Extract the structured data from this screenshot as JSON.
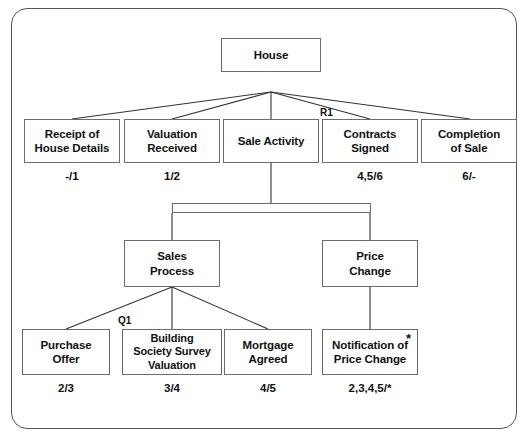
{
  "diagram": {
    "frame": {
      "border_color": "#555555",
      "background": "#ffffff"
    },
    "node_border_color": "#6b6b6b",
    "root": {
      "label": "House"
    },
    "level2": [
      {
        "label": "Receipt of\nHouse Details",
        "annotation": "-/1"
      },
      {
        "label": "Valuation\nReceived",
        "annotation": "1/2"
      },
      {
        "label": "Sale Activity",
        "annotation": ""
      },
      {
        "label": "Contracts\nSigned",
        "annotation": "4,5/6"
      },
      {
        "label": "Completion\nof Sale",
        "annotation": "6/-"
      }
    ],
    "level3": [
      {
        "label": "Sales\nProcess"
      },
      {
        "label": "Price\nChange"
      }
    ],
    "level4": [
      {
        "label": "Purchase\nOffer",
        "annotation": "2/3"
      },
      {
        "label": "Building\nSociety Survey\nValuation",
        "annotation": "3/4"
      },
      {
        "label": "Mortgage\nAgreed",
        "annotation": "4/5"
      },
      {
        "label": "Notification of\nPrice Change",
        "annotation": "2,3,4,5/*",
        "marker": "*"
      }
    ],
    "markers": [
      {
        "name": "R1",
        "text": "R1"
      },
      {
        "name": "Q1",
        "text": "Q1"
      }
    ]
  }
}
